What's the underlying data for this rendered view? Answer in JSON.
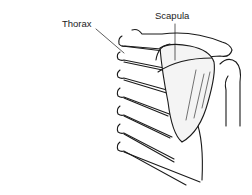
{
  "diagram": {
    "labels": {
      "thorax": "Thorax",
      "scapula": "Scapula"
    },
    "caption": ""
  }
}
